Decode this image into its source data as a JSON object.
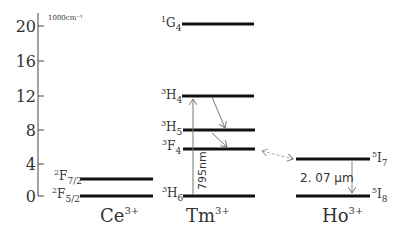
{
  "diagram": {
    "type": "energy-level",
    "axis": {
      "unit_label": "1000cm⁻¹",
      "ticks": [
        "20",
        "16",
        "12",
        "8",
        "4",
        "0"
      ]
    },
    "ions": [
      {
        "name": "Ce",
        "charge": "3+",
        "levels": [
          {
            "term": "F",
            "mult": "2",
            "j": "7/2"
          },
          {
            "term": "F",
            "mult": "2",
            "j": "5/2"
          }
        ]
      },
      {
        "name": "Tm",
        "charge": "3+",
        "levels": [
          {
            "term": "G",
            "mult": "1",
            "j": "4"
          },
          {
            "term": "H",
            "mult": "3",
            "j": "4"
          },
          {
            "term": "H",
            "mult": "3",
            "j": "5"
          },
          {
            "term": "F",
            "mult": "3",
            "j": "4"
          },
          {
            "term": "H",
            "mult": "3",
            "j": "6"
          }
        ]
      },
      {
        "name": "Ho",
        "charge": "3+",
        "levels": [
          {
            "term": "I",
            "mult": "5",
            "j": "7"
          },
          {
            "term": "I",
            "mult": "5",
            "j": "8"
          }
        ]
      }
    ],
    "annotations": {
      "pump": "795nm",
      "emission": "2. 07 μm"
    }
  }
}
